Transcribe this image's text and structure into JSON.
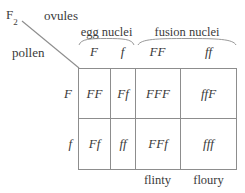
{
  "figure": {
    "generation_label": "F",
    "generation_subscript": "2",
    "axis_labels": {
      "columns": "ovules",
      "rows": "pollen"
    },
    "column_groups": [
      {
        "name": "egg-nuclei-group",
        "label": "egg nuclei",
        "spans": 2
      },
      {
        "name": "fusion-nuclei-group",
        "label": "fusion nuclei",
        "spans": 2
      }
    ],
    "column_headers": [
      "F",
      "f",
      "FF",
      "ff"
    ],
    "row_headers": [
      "F",
      "f"
    ],
    "cells": [
      [
        "FF",
        "Ff",
        "FFF",
        "ffF"
      ],
      [
        "Ff",
        "ff",
        "FFf",
        "fff"
      ]
    ],
    "bottom_labels": [
      "flinty",
      "floury"
    ],
    "colors": {
      "ink": "#3a3a3a",
      "rule": "#8d8d8d",
      "background": "#ffffff"
    }
  }
}
